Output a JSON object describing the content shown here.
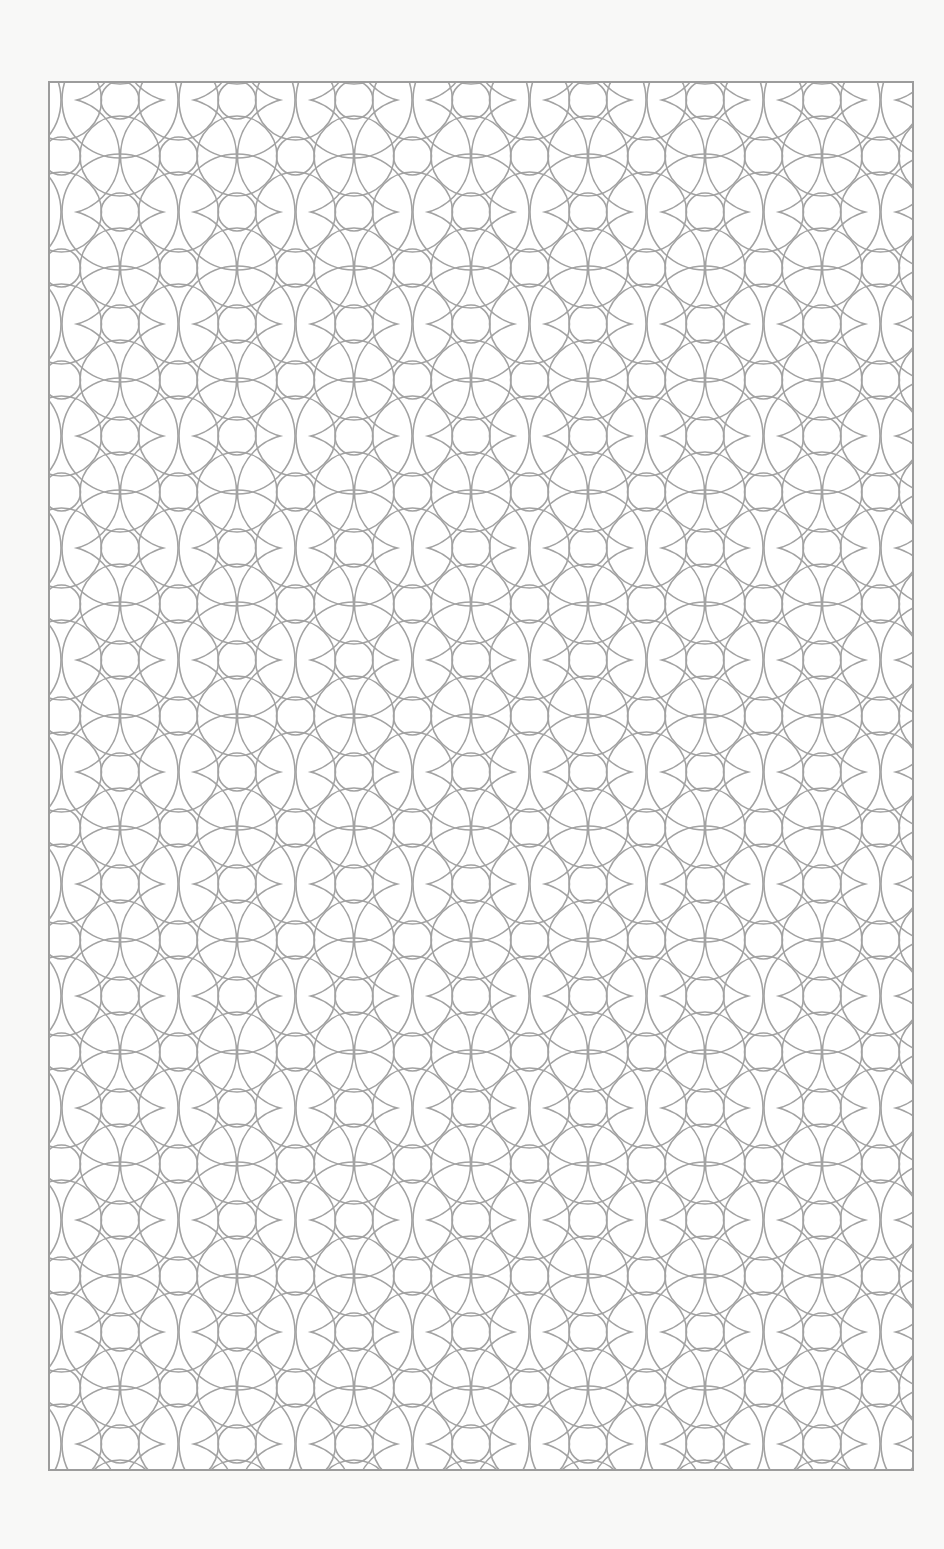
{
  "page": {
    "background": "#f8f8f7"
  },
  "panel": {
    "type": "geometric-circle-pattern",
    "fill": "#ffffff",
    "stroke_color": "#9c9c9c",
    "frame": {
      "x": 48,
      "y": 81,
      "width": 866,
      "height": 1390
    },
    "pattern": {
      "motif": "overlapping circles with small inner circles",
      "tile_width": 117,
      "tile_height": 112,
      "small_circle_radius": 19,
      "medium_circle_radius": 38,
      "large_circle_radius": 58
    }
  }
}
